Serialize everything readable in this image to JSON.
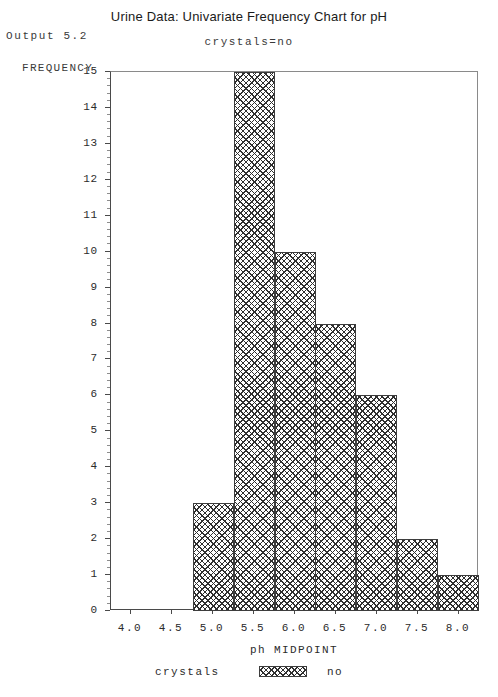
{
  "header": {
    "output_label": "Output 5.2",
    "title": "Urine Data: Univariate Frequency Chart for pH",
    "subtitle": "crystals=no"
  },
  "legend": {
    "title": "crystals",
    "value": "no",
    "swatch": "crosshatch-swatch"
  },
  "chart_data": {
    "type": "bar",
    "title": "Urine Data: Univariate Frequency Chart for pH",
    "subtitle": "crystals=no",
    "xlabel": "ph MIDPOINT",
    "ylabel": "FREQUENCY",
    "categories": [
      "4.0",
      "4.5",
      "5.0",
      "5.5",
      "6.0",
      "6.5",
      "7.0",
      "7.5",
      "8.0"
    ],
    "values": [
      0,
      0,
      3,
      15,
      10,
      8,
      6,
      2,
      1
    ],
    "x_tick_labels": [
      "4.0",
      "4.5",
      "5.0",
      "5.5",
      "6.0",
      "6.5",
      "7.0",
      "7.5",
      "8.0"
    ],
    "y_tick_labels": [
      "0",
      "1",
      "2",
      "3",
      "4",
      "5",
      "6",
      "7",
      "8",
      "9",
      "10",
      "11",
      "12",
      "13",
      "14",
      "15"
    ],
    "xlim": [
      3.75,
      8.25
    ],
    "ylim": [
      0,
      15
    ],
    "grid": false,
    "legend_position": "bottom-center",
    "bar_fill": "crosshatch",
    "bar_color": "#2f2f2f",
    "frame_color": "#4a4a4a",
    "series": [
      {
        "name": "no",
        "values": [
          0,
          0,
          3,
          15,
          10,
          8,
          6,
          2,
          1
        ]
      }
    ]
  }
}
